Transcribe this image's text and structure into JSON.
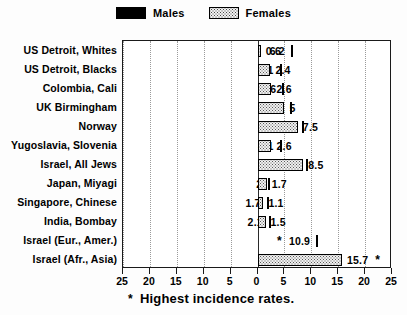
{
  "legend": {
    "items": [
      {
        "label": "Males",
        "swatch": "solid-black",
        "color": "#000000"
      },
      {
        "label": "Females",
        "swatch": "stippled",
        "color": "#f0f0f0"
      }
    ]
  },
  "caption": {
    "marker": "*",
    "text": "Highest incidence rates."
  },
  "chart_data": {
    "type": "bar",
    "orientation": "horizontal-diverging",
    "title": "",
    "subtitle": "",
    "xlabel": "",
    "ylabel": "",
    "xlim": [
      -25,
      25
    ],
    "xticks": [
      25,
      20,
      15,
      10,
      5,
      0,
      5,
      10,
      15,
      20,
      25
    ],
    "xtick_values": [
      -25,
      -20,
      -15,
      -10,
      -5,
      0,
      5,
      10,
      15,
      20,
      25
    ],
    "grid": true,
    "grid_axis": "x",
    "legend_position": "top-center",
    "annotation_marker": "*",
    "annotation_meaning": "Highest incidence rates.",
    "categories": [
      "US Detroit, Whites",
      "US Detroit, Blacks",
      "Colombia, Cali",
      "UK Birmingham",
      "Norway",
      "Yugoslavia, Slovenia",
      "Israel, All Jews",
      "Japan, Miyagi",
      "Singapore, Chinese",
      "India, Bombay",
      "Israel (Eur., Amer.)",
      "Israel (Afr., Asia)"
    ],
    "series": [
      {
        "name": "Males",
        "direction": "left",
        "values": [
          6.2,
          4.1,
          4.6,
          6.1,
          8.3,
          4.1,
          9,
          2,
          1.7,
          2.1,
          10.9,
          null
        ],
        "labels": [
          "6.2",
          "4.1",
          "4.6",
          "6.1",
          "8.3",
          "4.1",
          "9",
          "2",
          "1.7",
          "2.1",
          "10.9",
          ""
        ],
        "starred": [
          false,
          false,
          false,
          false,
          false,
          false,
          false,
          false,
          false,
          false,
          true,
          false
        ]
      },
      {
        "name": "Females",
        "direction": "right",
        "values": [
          0.6,
          2.4,
          2.6,
          5,
          7.5,
          2.6,
          8.5,
          1.7,
          1.1,
          1.5,
          null,
          15.7
        ],
        "labels": [
          "0.6",
          "2.4",
          "2.6",
          "5",
          "7.5",
          "2.6",
          "8.5",
          "1.7",
          "1.1",
          "1.5",
          "",
          "15.7"
        ],
        "starred": [
          false,
          false,
          false,
          false,
          false,
          false,
          false,
          false,
          false,
          false,
          false,
          true
        ]
      }
    ]
  }
}
